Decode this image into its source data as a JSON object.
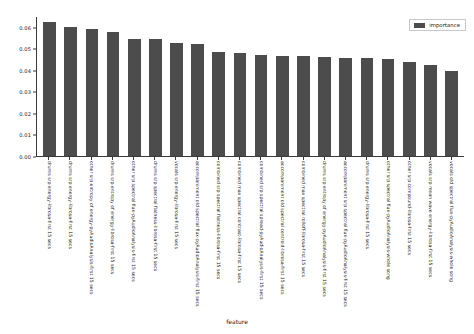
{
  "chart_data": {
    "type": "bar",
    "title": "",
    "xlabel": "feature",
    "ylabel": "",
    "ylim": [
      0.0,
      0.065
    ],
    "grid": false,
    "legend_position": "upper right",
    "legend": [
      "importance"
    ],
    "series": [
      {
        "name": "importance",
        "color": "#4c4c4c",
        "values": [
          0.062,
          0.06,
          0.0592,
          0.0575,
          0.0545,
          0.0541,
          0.0526,
          0.0521,
          0.0484,
          0.0477,
          0.047,
          0.0465,
          0.0463,
          0.0458,
          0.0456,
          0.0453,
          0.045,
          0.0438,
          0.0422,
          0.0393
        ]
      }
    ],
    "categories": [
      "drums srp energy-librosa-first 15 secs",
      "drums srp energy-librosa-first 15 secs",
      "other srp entropy of energy-pyAudioAnalysis-first 15 secs",
      "drums srp entropy of energy-librosa-first 15 secs",
      "other srp spectral flux-pyAudioAnalysis-first 15 secs",
      "drums srp spectral flatness-librosa-first 15 secs",
      "vocals srp energy-librosa-first 15 secs",
      "accompaniment old spectral flux-pyAudioAnalysis-first 15 secs",
      "combined srp spectral flatness-librosa-first 15 secs",
      "combined max spectral contrast-librosa-first 15 secs",
      "combined srp spectral spread-pyAudioAnalysis-first 15 secs",
      "accompaniment old spectral centroid-librosa-first 15 secs",
      "combined max spectral rolloff-librosa-first 15 secs",
      "drums srp entropy of energy-pyAudioAnalysis-first 15 secs",
      "accompaniment srp spectral flux-pyAudioAnalysis-first 15 secs",
      "drums srp energy-librosa-first 15 secs",
      "other srp spectral flux-pyAudioAnalysis-whole song",
      "other srp compound-librosa-first 15 secs",
      "vocals srp mean wave energy-librosa-first 15 secs",
      "vocals old spectral flux-pyAudioAnalysis-whole song"
    ],
    "yticks": [
      "0.00",
      "0.01",
      "0.02",
      "0.03",
      "0.04",
      "0.05",
      "0.06"
    ],
    "ytick_values": [
      0.0,
      0.01,
      0.02,
      0.03,
      0.04,
      0.05,
      0.06
    ]
  }
}
